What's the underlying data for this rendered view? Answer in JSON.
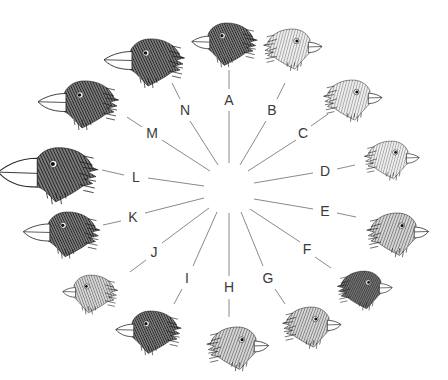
{
  "diagram": {
    "title": "",
    "center": {
      "x": 229,
      "y": 188
    },
    "line_color": "#8a8a8a",
    "label_color": "#3a3a3a",
    "spokes": [
      {
        "id": "A",
        "label": "A",
        "lx": 229,
        "ly": 100,
        "inner": [
          229,
          163,
          229,
          111
        ],
        "outer": [
          229,
          89,
          229,
          70
        ],
        "bird": {
          "x": 226,
          "y": 42,
          "scale": 0.9,
          "facing": "left",
          "beak": "medium",
          "tone": "dark"
        }
      },
      {
        "id": "B",
        "label": "B",
        "lx": 272,
        "ly": 110,
        "inner": [
          240,
          165,
          266,
          121
        ],
        "outer": [
          277,
          99,
          285,
          83
        ],
        "bird": {
          "x": 293,
          "y": 47,
          "scale": 0.85,
          "facing": "right",
          "beak": "small",
          "tone": "light"
        }
      },
      {
        "id": "C",
        "label": "C",
        "lx": 303,
        "ly": 133,
        "inner": [
          248,
          171,
          296,
          140
        ],
        "outer": [
          311,
          126,
          328,
          114
        ],
        "bird": {
          "x": 353,
          "y": 98,
          "scale": 0.85,
          "facing": "right",
          "beak": "small",
          "tone": "light"
        }
      },
      {
        "id": "D",
        "label": "D",
        "lx": 325,
        "ly": 171,
        "inner": [
          254,
          183,
          313,
          173
        ],
        "outer": [
          337,
          169,
          355,
          165
        ],
        "bird": {
          "x": 392,
          "y": 158,
          "scale": 0.8,
          "facing": "right",
          "beak": "small",
          "tone": "light"
        }
      },
      {
        "id": "E",
        "label": "E",
        "lx": 325,
        "ly": 211,
        "inner": [
          254,
          199,
          313,
          209
        ],
        "outer": [
          337,
          213,
          356,
          217
        ],
        "bird": {
          "x": 398,
          "y": 232,
          "scale": 0.9,
          "facing": "right",
          "beak": "small",
          "tone": "medium"
        }
      },
      {
        "id": "F",
        "label": "F",
        "lx": 307,
        "ly": 249,
        "inner": [
          250,
          209,
          300,
          242
        ],
        "outer": [
          315,
          257,
          331,
          268
        ],
        "bird": {
          "x": 365,
          "y": 288,
          "scale": 0.8,
          "facing": "right",
          "beak": "small",
          "tone": "dark"
        }
      },
      {
        "id": "G",
        "label": "G",
        "lx": 268,
        "ly": 278,
        "inner": [
          241,
          212,
          263,
          266
        ],
        "outer": [
          275,
          289,
          285,
          304
        ],
        "bird": {
          "x": 312,
          "y": 325,
          "scale": 0.85,
          "facing": "right",
          "beak": "small",
          "tone": "medium"
        }
      },
      {
        "id": "H",
        "label": "H",
        "lx": 229,
        "ly": 287,
        "inner": [
          229,
          213,
          229,
          276
        ],
        "outer": [
          229,
          299,
          229,
          317
        ],
        "bird": {
          "x": 238,
          "y": 346,
          "scale": 0.9,
          "facing": "right",
          "beak": "small",
          "tone": "medium"
        }
      },
      {
        "id": "I",
        "label": "I",
        "lx": 187,
        "ly": 278,
        "inner": [
          217,
          212,
          193,
          266
        ],
        "outer": [
          182,
          289,
          174,
          304
        ],
        "bird": {
          "x": 150,
          "y": 330,
          "scale": 0.9,
          "facing": "left",
          "beak": "medium",
          "tone": "dark"
        }
      },
      {
        "id": "J",
        "label": "J",
        "lx": 154,
        "ly": 252,
        "inner": [
          209,
          208,
          162,
          243
        ],
        "outer": [
          146,
          260,
          130,
          272
        ],
        "bird": {
          "x": 90,
          "y": 292,
          "scale": 0.8,
          "facing": "left",
          "beak": "small",
          "tone": "medium"
        }
      },
      {
        "id": "K",
        "label": "K",
        "lx": 133,
        "ly": 217,
        "inner": [
          204,
          198,
          145,
          213
        ],
        "outer": [
          121,
          221,
          103,
          225
        ],
        "bird": {
          "x": 67,
          "y": 232,
          "scale": 0.95,
          "facing": "left",
          "beak": "large",
          "tone": "dark"
        }
      },
      {
        "id": "L",
        "label": "L",
        "lx": 136,
        "ly": 177,
        "inner": [
          204,
          186,
          148,
          178
        ],
        "outer": [
          124,
          175,
          102,
          170
        ],
        "bird": {
          "x": 58,
          "y": 172,
          "scale": 1.15,
          "facing": "left",
          "beak": "huge",
          "tone": "dark"
        }
      },
      {
        "id": "M",
        "label": "M",
        "lx": 152,
        "ly": 133,
        "inner": [
          210,
          171,
          162,
          140
        ],
        "outer": [
          142,
          127,
          127,
          117
        ],
        "bird": {
          "x": 84,
          "y": 102,
          "scale": 1.0,
          "facing": "left",
          "beak": "large",
          "tone": "dark"
        }
      },
      {
        "id": "N",
        "label": "N",
        "lx": 185,
        "ly": 110,
        "inner": [
          218,
          165,
          190,
          121
        ],
        "outer": [
          180,
          99,
          172,
          83
        ],
        "bird": {
          "x": 150,
          "y": 60,
          "scale": 1.0,
          "facing": "left",
          "beak": "large",
          "tone": "dark"
        }
      }
    ]
  }
}
